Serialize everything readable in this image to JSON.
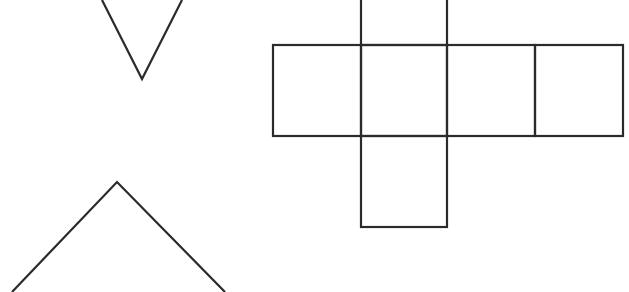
{
  "diagram": {
    "stroke_color": "#2b2b2b",
    "background": "#ffffff",
    "shapes": {
      "top_triangle": {
        "type": "partial-triangle-pointing-down",
        "points": [
          [
            102,
            0
          ],
          [
            142,
            79
          ],
          [
            182,
            0
          ]
        ]
      },
      "bottom_triangle": {
        "type": "partial-triangle-pointing-up",
        "points": [
          [
            12,
            292
          ],
          [
            117,
            182
          ],
          [
            225,
            292
          ]
        ]
      },
      "cube_net": {
        "type": "cube-net",
        "cells": [
          {
            "id": "top",
            "x": 361,
            "y": -2,
            "w": 86,
            "h": 47
          },
          {
            "id": "left",
            "x": 273,
            "y": 45,
            "w": 88,
            "h": 91
          },
          {
            "id": "center",
            "x": 361,
            "y": 45,
            "w": 86,
            "h": 91
          },
          {
            "id": "right",
            "x": 447,
            "y": 45,
            "w": 88,
            "h": 91
          },
          {
            "id": "far-right",
            "x": 535,
            "y": 45,
            "w": 88,
            "h": 91
          },
          {
            "id": "bottom",
            "x": 361,
            "y": 136,
            "w": 86,
            "h": 91
          }
        ]
      }
    }
  }
}
